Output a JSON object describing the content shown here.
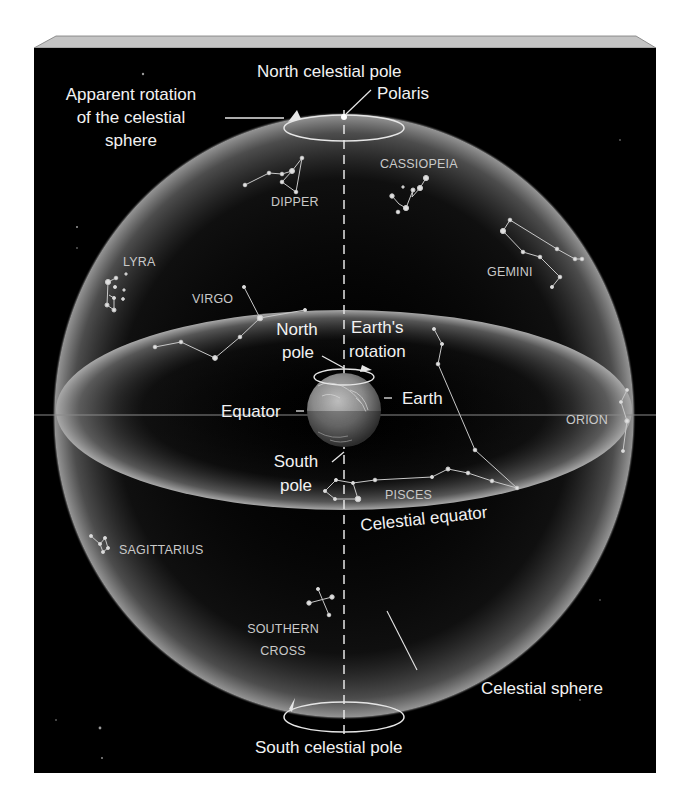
{
  "figure": {
    "colors": {
      "background": "#000000",
      "sphere_glow": "#9a9a9a",
      "line": "#e6e6e6",
      "label": "#f2f2f2",
      "constellation_label": "#c9c9c9",
      "frame_bevel": "#bdbdbd"
    }
  },
  "labels": {
    "north_celestial_pole": "North celestial pole",
    "polaris": "Polaris",
    "apparent_rotation": [
      "Apparent rotation",
      "of the celestial",
      "sphere"
    ],
    "north_pole": [
      "North",
      "pole"
    ],
    "earths_rotation": [
      "Earth's",
      "rotation"
    ],
    "earth": "Earth",
    "equator": "Equator",
    "south_pole": [
      "South",
      "pole"
    ],
    "celestial_equator": "Celestial equator",
    "celestial_sphere": "Celestial sphere",
    "south_celestial_pole": "South celestial pole"
  },
  "constellations": {
    "dipper": "DIPPER",
    "cassiopeia": "CASSIOPEIA",
    "lyra": "LYRA",
    "virgo": "VIRGO",
    "gemini": "GEMINI",
    "orion": "ORION",
    "pisces": "PISCES",
    "sagittarius": "SAGITTARIUS",
    "southern_cross": [
      "SOUTHERN",
      "CROSS"
    ]
  }
}
